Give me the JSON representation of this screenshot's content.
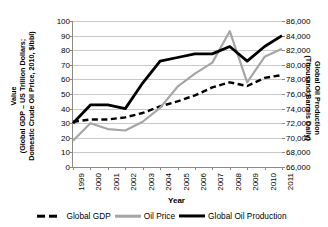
{
  "chart_data": {
    "type": "line",
    "title": "",
    "xlabel": "Year",
    "ylabel_left": "Value\n(Global GDP – US Trillion Dollars; Domestic Crude Oil Price, 2010, $/bbl)",
    "ylabel_left_line1": "Value",
    "ylabel_left_line2": "(Global GDP – US Trillion Dollars;",
    "ylabel_left_line3": "Domestic Crude Oil Price, 2010, $/bbl)",
    "ylabel_right_line1": "Global Oil Production",
    "ylabel_right_line2": "(Thousand Barrels Daily)",
    "categories": [
      "1999",
      "2000",
      "2001",
      "2002",
      "2003",
      "2004",
      "2005",
      "2006",
      "2007",
      "2008",
      "2009",
      "2010",
      "2011"
    ],
    "ylim_left": [
      0,
      100
    ],
    "ytick_left": [
      "0",
      "10",
      "20",
      "30",
      "40",
      "50",
      "60",
      "70",
      "80",
      "90",
      "100"
    ],
    "ylim_right": [
      66000,
      86000
    ],
    "ytick_right": [
      "66,000",
      "68,000",
      "70,000",
      "72,000",
      "74,000",
      "76,000",
      "78,000",
      "80,000",
      "82,000",
      "84,000",
      "86,000"
    ],
    "grid": true,
    "legend_position": "bottom",
    "series": [
      {
        "name": "Global GDP",
        "axis": "left",
        "style": "dashed",
        "color": "#000000",
        "values": [
          31.0,
          32.5,
          32.5,
          34.0,
          37.0,
          41.5,
          45.0,
          49.0,
          54.5,
          58.0,
          55.5,
          61.0,
          63.0
        ]
      },
      {
        "name": "Oil Price",
        "axis": "left",
        "style": "solid",
        "color": "#a6a6a6",
        "values": [
          18.0,
          30.0,
          26.0,
          25.0,
          31.0,
          40.5,
          55.0,
          64.0,
          71.5,
          93.0,
          58.0,
          75.5,
          81.0
        ]
      },
      {
        "name": "Global Oil Production",
        "axis": "right",
        "style": "solid-thick",
        "color": "#000000",
        "values": [
          72000,
          74500,
          74500,
          74000,
          77500,
          80500,
          81000,
          81500,
          81500,
          82500,
          80500,
          82500,
          84000
        ]
      }
    ]
  },
  "legend": {
    "items": [
      {
        "label": "Global GDP"
      },
      {
        "label": "Oil Price"
      },
      {
        "label": "Global Oil Production"
      }
    ]
  }
}
